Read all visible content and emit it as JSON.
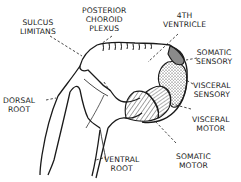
{
  "diagram": {
    "type": "anatomical-cross-section",
    "labels": {
      "sulcus_limitans": [
        "SULCUS",
        "LIMITANS"
      ],
      "posterior_choroid_plexus": [
        "POSTERIOR",
        "CHOROID",
        "PLEXUS"
      ],
      "fourth_ventricle": [
        "4TH",
        "VENTRICLE"
      ],
      "somatic_sensory": [
        "SOMATIC",
        "SENSORY"
      ],
      "visceral_sensory": [
        "VISCERAL",
        "SENSORY"
      ],
      "visceral_motor": [
        "VISCERAL",
        "MOTOR"
      ],
      "somatic_motor": [
        "SOMATIC",
        "MOTOR"
      ],
      "dorsal_root": [
        "DORSAL",
        "ROOT"
      ],
      "ventral_root": [
        "VENTRAL",
        "ROOT"
      ]
    },
    "regions": [
      {
        "name": "somatic sensory",
        "fill": "dark gray shading"
      },
      {
        "name": "visceral sensory",
        "fill": "stippled dots"
      },
      {
        "name": "visceral motor",
        "fill": "fine diagonal hatching"
      },
      {
        "name": "somatic motor",
        "fill": "coarse diagonal hatching"
      }
    ],
    "colors": {
      "ink": "#1a1a1a",
      "background": "#ffffff",
      "shade": "#8a8a8a"
    }
  }
}
